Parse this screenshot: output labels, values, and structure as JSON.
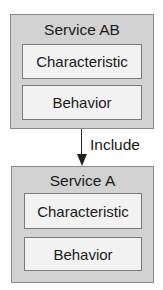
{
  "diagram": {
    "top_service": {
      "title": "Service AB",
      "parts": [
        "Characteristic",
        "Behavior"
      ]
    },
    "relation": {
      "label": "Include",
      "direction": "down"
    },
    "bottom_service": {
      "title": "Service A",
      "parts": [
        "Characteristic",
        "Behavior"
      ]
    }
  },
  "colors": {
    "outer_fill": "#d2d2d2",
    "inner_fill": "#f2f2f2",
    "stroke": "#222222"
  }
}
